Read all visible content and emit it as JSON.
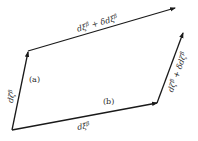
{
  "diagram": {
    "type": "vector-parallelogram",
    "colors": {
      "line": "#1a1a1a",
      "text": "#2a2a2a",
      "background": "#ffffff"
    },
    "vectors": {
      "left": {
        "label": "dζ^β"
      },
      "top": {
        "label": "dξ^β + δdξ^β"
      },
      "bottom": {
        "label": "dξ^β"
      },
      "right": {
        "label": "dζ^β + δdζ^β"
      }
    },
    "paths": {
      "a": {
        "label": "(a)"
      },
      "b": {
        "label": "(b)"
      }
    }
  }
}
